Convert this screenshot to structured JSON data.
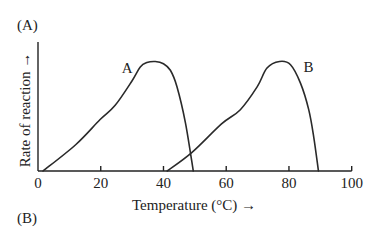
{
  "panel_labels": {
    "top": "(A)",
    "bottom": "(B)"
  },
  "chart_data": {
    "type": "line",
    "title": "",
    "xlabel": "Temperature (°C) →",
    "ylabel": "Rate of reaction →",
    "xlim": [
      0,
      100
    ],
    "ylim": [
      0,
      1.18
    ],
    "x_ticks": [
      0,
      20,
      40,
      60,
      80,
      100
    ],
    "x_tick_labels": [
      "0",
      "20",
      "40",
      "60",
      "80",
      "100"
    ],
    "y_ticks": [],
    "grid": false,
    "legend": "none (curves labeled directly)",
    "y_units": "relative rate (no scale shown; peak = 1.0)",
    "series": [
      {
        "name": "A",
        "label_position": {
          "x": 28.4,
          "y": 0.94
        },
        "optimum_temperature": 37,
        "x": [
          1.6,
          12,
          19.8,
          24.6,
          29.9,
          32.6,
          34.7,
          37.4,
          40,
          42.2,
          44.3,
          47,
          49.5
        ],
        "y": [
          0,
          0.24,
          0.47,
          0.6,
          0.82,
          0.95,
          0.99,
          1.0,
          0.98,
          0.92,
          0.77,
          0.44,
          0
        ]
      },
      {
        "name": "B",
        "label_position": {
          "x": 86.2,
          "y": 0.95
        },
        "optimum_temperature": 77,
        "x": [
          41.2,
          49.1,
          58.5,
          64.5,
          69.9,
          73,
          77,
          80.5,
          83.7,
          86.3,
          87.9,
          89.4
        ],
        "y": [
          0,
          0.17,
          0.43,
          0.56,
          0.77,
          0.94,
          1.0,
          0.97,
          0.8,
          0.56,
          0.31,
          0
        ]
      }
    ]
  }
}
